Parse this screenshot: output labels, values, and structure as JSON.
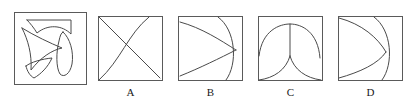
{
  "question": {
    "type": "figure-assembly",
    "prompt_visible": false,
    "pieces_panel_label": "",
    "choice_labels": [
      "A",
      "B",
      "C",
      "D"
    ]
  },
  "colors": {
    "stroke": "#4a4a4a",
    "frame": "#5a5a5a",
    "background": "#ffffff",
    "label_text": "#1a1a1a"
  },
  "panels": [
    {
      "id": "pieces",
      "label": "",
      "description": "four separated puzzle pieces: curved top bridge, large arrow triangle, leaf petal, small quadrilateral",
      "shapes": [
        {
          "name": "piece-top-bridge",
          "kind": "arc-bridge"
        },
        {
          "name": "piece-arrow-triangle",
          "kind": "concave-triangle"
        },
        {
          "name": "piece-leaf-petal",
          "kind": "petal"
        },
        {
          "name": "piece-small-quad",
          "kind": "quadrilateral"
        }
      ]
    },
    {
      "id": "choice-a",
      "label": "A",
      "description": "diagonal cross line with a curve bulging left from top-right to bottom-left",
      "shapes": [
        {
          "name": "diagonal-line",
          "kind": "line"
        },
        {
          "name": "left-bulging-curve",
          "kind": "curve"
        }
      ]
    },
    {
      "id": "choice-b",
      "label": "B",
      "description": "three curves converging at a point on the right edge forming fan wings",
      "shapes": [
        {
          "name": "upper-wing-curve",
          "kind": "curve"
        },
        {
          "name": "lower-wing-curve",
          "kind": "curve"
        },
        {
          "name": "right-arc",
          "kind": "curve"
        }
      ]
    },
    {
      "id": "choice-c",
      "label": "C",
      "description": "semicircular dome with centre stem and two curves rising from bottom corners",
      "shapes": [
        {
          "name": "dome-arc",
          "kind": "curve"
        },
        {
          "name": "center-stem",
          "kind": "line"
        },
        {
          "name": "left-corner-curve",
          "kind": "curve"
        },
        {
          "name": "right-corner-curve",
          "kind": "curve"
        }
      ]
    },
    {
      "id": "choice-d",
      "label": "D",
      "description": "two curves from left corners meeting at a point with a large right arc",
      "shapes": [
        {
          "name": "upper-left-curve",
          "kind": "curve"
        },
        {
          "name": "lower-left-curve",
          "kind": "curve"
        },
        {
          "name": "right-arc",
          "kind": "curve"
        }
      ]
    }
  ]
}
